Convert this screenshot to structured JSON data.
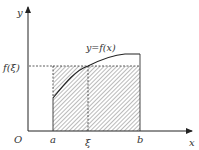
{
  "diagram": {
    "axes": {
      "x_label": "x",
      "y_label": "y",
      "origin_label": "O"
    },
    "curve_label": "y=f(x)",
    "level_label": "f(ξ)",
    "points": {
      "a_label": "a",
      "xi_label": "ξ",
      "b_label": "b"
    },
    "colors": {
      "line": "#333333",
      "hatch": "#555555",
      "background": "#ffffff"
    }
  }
}
